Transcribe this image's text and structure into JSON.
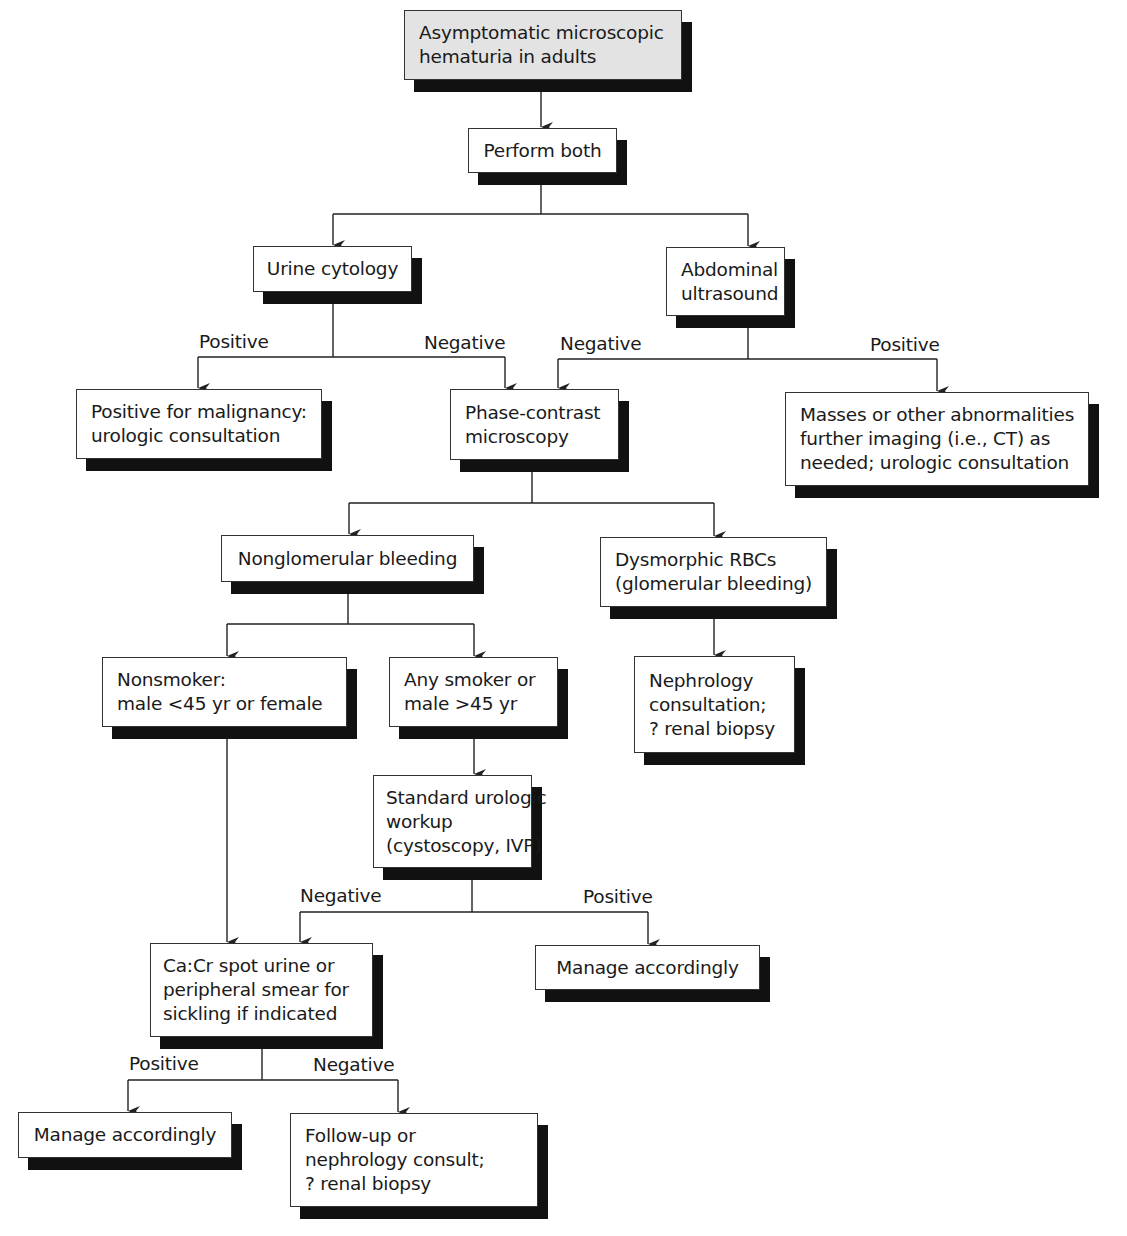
{
  "diagram": {
    "type": "clinical-flowchart",
    "nodes": {
      "root": {
        "lines": [
          "Asymptomatic microscopic",
          "hematuria in adults"
        ]
      },
      "perform_both": {
        "lines": [
          "Perform both"
        ]
      },
      "urine_cytology": {
        "lines": [
          "Urine cytology"
        ]
      },
      "abdominal_ultrasound": {
        "lines": [
          "Abdominal",
          "ultrasound"
        ]
      },
      "positive_malignancy": {
        "lines": [
          "Positive for malignancy:",
          "urologic consultation"
        ]
      },
      "phase_contrast": {
        "lines": [
          "Phase-contrast",
          "microscopy"
        ]
      },
      "masses": {
        "lines": [
          "Masses or other abnormalities",
          "further imaging (i.e., CT) as",
          "needed; urologic consultation"
        ]
      },
      "nonglomerular": {
        "lines": [
          "Nonglomerular bleeding"
        ]
      },
      "dysmorphic": {
        "lines": [
          "Dysmorphic RBCs",
          "(glomerular bleeding)"
        ]
      },
      "nonsmoker": {
        "lines": [
          "Nonsmoker:",
          "male <45 yr or female"
        ]
      },
      "any_smoker": {
        "lines": [
          "Any smoker or",
          "male >45 yr"
        ]
      },
      "nephrology_consultation": {
        "lines": [
          "Nephrology",
          "consultation;",
          "? renal biopsy"
        ]
      },
      "standard_urologic": {
        "lines": [
          "Standard urologic",
          "workup",
          "(cystoscopy, IVP)"
        ]
      },
      "cacr_spot": {
        "lines": [
          "Ca:Cr spot urine or",
          "peripheral smear for",
          "sickling if indicated"
        ]
      },
      "manage_right": {
        "lines": [
          "Manage accordingly"
        ]
      },
      "manage_left": {
        "lines": [
          "Manage accordingly"
        ]
      },
      "follow_up": {
        "lines": [
          "Follow-up or",
          "nephrology consult;",
          "? renal biopsy"
        ]
      }
    },
    "edge_labels": {
      "cytology_positive": "Positive",
      "cytology_negative": "Negative",
      "ultrasound_negative": "Negative",
      "ultrasound_positive": "Positive",
      "workup_negative": "Negative",
      "workup_positive": "Positive",
      "cacr_positive": "Positive",
      "cacr_negative": "Negative"
    },
    "edges": [
      {
        "from": "root",
        "to": "perform_both"
      },
      {
        "from": "perform_both",
        "to": "urine_cytology"
      },
      {
        "from": "perform_both",
        "to": "abdominal_ultrasound"
      },
      {
        "from": "urine_cytology",
        "to": "positive_malignancy",
        "label": "Positive"
      },
      {
        "from": "urine_cytology",
        "to": "phase_contrast",
        "label": "Negative"
      },
      {
        "from": "abdominal_ultrasound",
        "to": "phase_contrast",
        "label": "Negative"
      },
      {
        "from": "abdominal_ultrasound",
        "to": "masses",
        "label": "Positive"
      },
      {
        "from": "phase_contrast",
        "to": "nonglomerular"
      },
      {
        "from": "phase_contrast",
        "to": "dysmorphic"
      },
      {
        "from": "nonglomerular",
        "to": "nonsmoker"
      },
      {
        "from": "nonglomerular",
        "to": "any_smoker"
      },
      {
        "from": "dysmorphic",
        "to": "nephrology_consultation"
      },
      {
        "from": "any_smoker",
        "to": "standard_urologic"
      },
      {
        "from": "nonsmoker",
        "to": "cacr_spot"
      },
      {
        "from": "standard_urologic",
        "to": "cacr_spot",
        "label": "Negative"
      },
      {
        "from": "standard_urologic",
        "to": "manage_right",
        "label": "Positive"
      },
      {
        "from": "cacr_spot",
        "to": "manage_left",
        "label": "Positive"
      },
      {
        "from": "cacr_spot",
        "to": "follow_up",
        "label": "Negative"
      }
    ],
    "colors": {
      "root_fill": "#e3e3e3",
      "box_fill": "#ffffff",
      "shadow": "#111111",
      "line": "#222222"
    }
  }
}
